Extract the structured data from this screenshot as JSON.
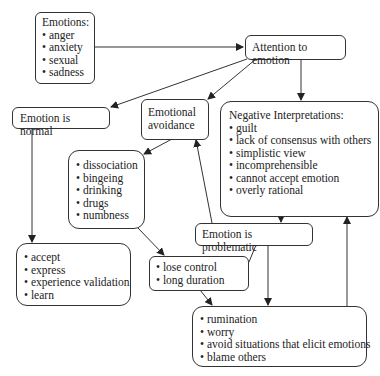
{
  "diagram": {
    "nodes": {
      "emotions": {
        "title": "Emotions:",
        "items": [
          "anger",
          "anxiety",
          "sexual",
          "sadness"
        ]
      },
      "attention": {
        "label": "Attention to emotion"
      },
      "normal": {
        "label": "Emotion is normal"
      },
      "avoidance": {
        "line1": "Emotional",
        "line2": "avoidance"
      },
      "negative": {
        "title": "Negative Interpretations:",
        "items": [
          "guilt",
          "lack of consensus with others",
          "simplistic view",
          "incomprehensible",
          "cannot accept emotion",
          "overly rational"
        ]
      },
      "avoid_behaviors": {
        "items": [
          "dissociation",
          "bingeing",
          "drinking",
          "drugs",
          "numbness"
        ]
      },
      "normal_outcomes": {
        "items": [
          "accept",
          "express",
          "experience validation",
          "learn"
        ]
      },
      "problematic": {
        "label": "Emotion is problematic"
      },
      "consequences": {
        "items": [
          "lose control",
          "long duration"
        ]
      },
      "coping": {
        "items": [
          "rumination",
          "worry",
          "avoid situations that elicit emotions",
          "blame others"
        ]
      }
    },
    "edges": [
      {
        "from": "emotions",
        "to": "attention"
      },
      {
        "from": "attention",
        "to": "normal"
      },
      {
        "from": "attention",
        "to": "avoidance"
      },
      {
        "from": "attention",
        "to": "negative"
      },
      {
        "from": "normal",
        "to": "normal_outcomes"
      },
      {
        "from": "avoidance",
        "to": "avoid_behaviors"
      },
      {
        "from": "negative",
        "to": "problematic"
      },
      {
        "from": "problematic",
        "to": "avoidance"
      },
      {
        "from": "avoid_behaviors",
        "to": "consequences"
      },
      {
        "from": "problematic",
        "to": "consequences"
      },
      {
        "from": "problematic",
        "to": "coping"
      },
      {
        "from": "consequences",
        "to": "coping"
      },
      {
        "from": "coping",
        "to": "negative"
      }
    ],
    "colors": {
      "line": "#333333",
      "background": "#ffffff"
    }
  }
}
